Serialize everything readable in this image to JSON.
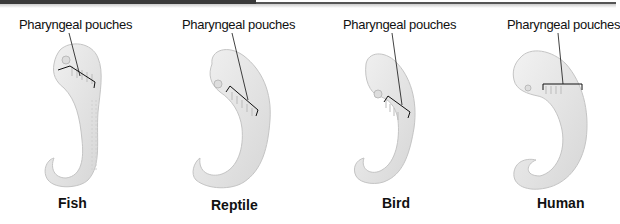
{
  "figure": {
    "panels": [
      {
        "label": "Pharyngeal pouches",
        "name": "Fish"
      },
      {
        "label": "Pharyngeal pouches",
        "name": "Reptile"
      },
      {
        "label": "Pharyngeal pouches",
        "name": "Bird"
      },
      {
        "label": "Pharyngeal pouches",
        "name": "Human"
      }
    ],
    "colors": {
      "embryo_fill": "#e4e4e4",
      "embryo_stroke": "#c2c2c2",
      "leader": "#111111",
      "header_bar": "#3a3a3a"
    }
  }
}
